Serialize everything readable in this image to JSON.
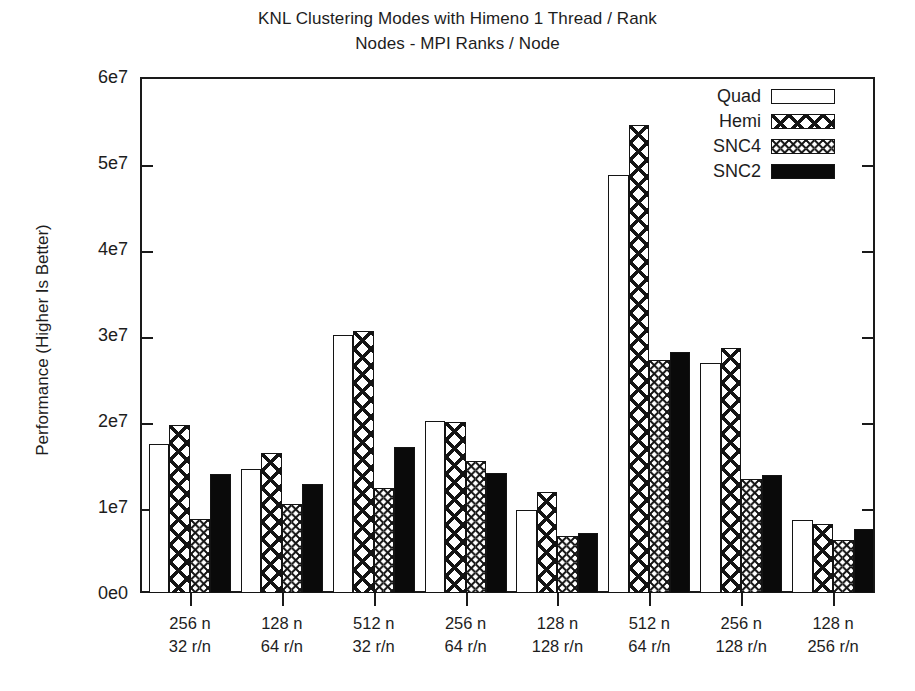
{
  "chart_data": {
    "type": "bar",
    "title": "KNL Clustering Modes with Himeno 1 Thread / Rank",
    "subtitle": "Nodes - MPI Ranks / Node",
    "xlabel": "",
    "ylabel": "Performance (Higher Is Better)",
    "ylim": [
      0,
      60000000
    ],
    "ytick_labels": [
      "0e0",
      "1e7",
      "2e7",
      "3e7",
      "4e7",
      "5e7",
      "6e7"
    ],
    "ytick_values": [
      0,
      10000000,
      20000000,
      30000000,
      40000000,
      50000000,
      60000000
    ],
    "grid": false,
    "legend_position": "top-right",
    "categories": [
      {
        "line1": "256 n",
        "line2": "32 r/n"
      },
      {
        "line1": "128 n",
        "line2": "64 r/n"
      },
      {
        "line1": "512 n",
        "line2": "32 r/n"
      },
      {
        "line1": "256 n",
        "line2": "64 r/n"
      },
      {
        "line1": "128 n",
        "line2": "128 r/n"
      },
      {
        "line1": "512 n",
        "line2": "64 r/n"
      },
      {
        "line1": "256 n",
        "line2": "128 r/n"
      },
      {
        "line1": "128 n",
        "line2": "256 r/n"
      }
    ],
    "series": [
      {
        "name": "Quad",
        "pattern": "open",
        "values": [
          17300000,
          14400000,
          30000000,
          20000000,
          9600000,
          48600000,
          26800000,
          8500000
        ]
      },
      {
        "name": "Hemi",
        "pattern": "coarse-cross-hatch",
        "values": [
          19500000,
          16300000,
          30500000,
          19900000,
          11800000,
          54400000,
          28500000,
          8000000
        ]
      },
      {
        "name": "SNC4",
        "pattern": "fine-cross-hatch",
        "values": [
          8600000,
          10300000,
          12200000,
          15400000,
          6600000,
          27100000,
          13200000,
          6200000
        ]
      },
      {
        "name": "SNC2",
        "pattern": "solid-black",
        "values": [
          13800000,
          12700000,
          17000000,
          13900000,
          7000000,
          28000000,
          13700000,
          7500000
        ]
      }
    ],
    "colors": {
      "axis": "#1a1a1a",
      "text": "#1d1d1d",
      "bar_outline": "#141414",
      "solid_fill": "#0a0a0a",
      "background": "#ffffff"
    }
  }
}
